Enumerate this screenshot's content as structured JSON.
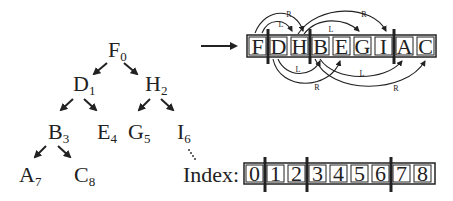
{
  "tree": {
    "nodes": [
      {
        "letter": "F",
        "index": "0"
      },
      {
        "letter": "D",
        "index": "1"
      },
      {
        "letter": "H",
        "index": "2"
      },
      {
        "letter": "B",
        "index": "3"
      },
      {
        "letter": "E",
        "index": "4"
      },
      {
        "letter": "G",
        "index": "5"
      },
      {
        "letter": "I",
        "index": "6"
      },
      {
        "letter": "A",
        "index": "7"
      },
      {
        "letter": "C",
        "index": "8"
      }
    ]
  },
  "array": {
    "cells": [
      "F",
      "D",
      "H",
      "B",
      "E",
      "G",
      "I",
      "A",
      "C"
    ],
    "separators_after": [
      0,
      2,
      6
    ]
  },
  "index_row": {
    "label": "Index:",
    "cells": [
      "0",
      "1",
      "2",
      "3",
      "4",
      "5",
      "6",
      "7",
      "8"
    ]
  },
  "arrow_labels": {
    "top": [
      "L",
      "R",
      "L",
      "R"
    ],
    "bottom": [
      "L",
      "R",
      "L",
      "R"
    ]
  }
}
